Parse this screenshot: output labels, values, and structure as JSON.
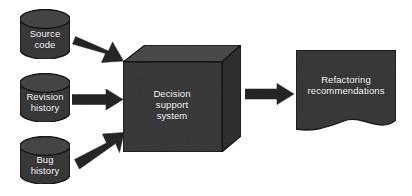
{
  "diagram": {
    "background_color": "#ffffff",
    "shape_fill": "#3a3a3a",
    "shape_fill_light": "#4a4a4a",
    "shape_outline": "#1a1a1a",
    "arrow_color": "#262626",
    "label_color": "#ffffff",
    "inputs": [
      {
        "id": "source-code",
        "label": "Source\ncode",
        "shape": "cylinder"
      },
      {
        "id": "revision-history",
        "label": "Revision\nhistory",
        "shape": "cylinder"
      },
      {
        "id": "bug-history",
        "label": "Bug\nhistory",
        "shape": "cylinder"
      }
    ],
    "process": {
      "id": "decision-support-system",
      "label": "Decision\nsupport\nsystem",
      "shape": "cube"
    },
    "output": {
      "id": "refactoring-recommendations",
      "label": "Refactoring\nrecommendations",
      "shape": "document"
    },
    "arrows": [
      {
        "id": "arrow-source-code-to-dss",
        "direction": "down-right"
      },
      {
        "id": "arrow-revision-history-to-dss",
        "direction": "right"
      },
      {
        "id": "arrow-bug-history-to-dss",
        "direction": "up-right"
      },
      {
        "id": "arrow-dss-to-recommendations",
        "direction": "right"
      }
    ]
  }
}
